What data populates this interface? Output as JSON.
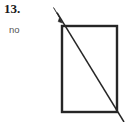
{
  "figure": {
    "problem_number": "13.",
    "answer": "no",
    "background_color": "#ffffff",
    "text_color": "#1a1a1a",
    "answer_color": "#555555",
    "stroke_color": "#262626",
    "rectangle": {
      "name": "rectangle",
      "x": 62,
      "y": 26,
      "width": 55,
      "height": 86,
      "stroke_width": 2.4,
      "fill": "none"
    },
    "diagonal_ray": {
      "name": "diagonal-ray",
      "x1": 124,
      "y1": 122,
      "x2": 56,
      "y2": 11,
      "stroke_width": 1.5,
      "arrowhead_at": "upper-left",
      "arrowhead_points": "54,8 62,22 57,22 60,19"
    }
  }
}
